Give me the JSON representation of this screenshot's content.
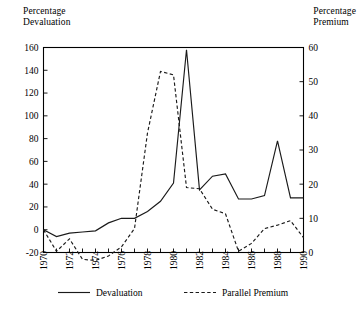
{
  "chart_data": {
    "type": "line",
    "title": "",
    "xlabel": "",
    "ylabel": "Percentage Devaluation",
    "y2label": "Percentage Premium",
    "grid": false,
    "legend_position": "bottom",
    "x": [
      1970,
      1971,
      1972,
      1973,
      1974,
      1975,
      1976,
      1977,
      1978,
      1979,
      1980,
      1981,
      1982,
      1983,
      1984,
      1985,
      1986,
      1987,
      1988,
      1989,
      1990
    ],
    "xlim": [
      1970,
      1990
    ],
    "xticks_major": [
      1970,
      1972,
      1974,
      1976,
      1978,
      1980,
      1982,
      1984,
      1986,
      1988,
      1990
    ],
    "xtick_labels": [
      "1970",
      "1972",
      "1974",
      "1976",
      "1978",
      "1980",
      "1982",
      "1984",
      "1986",
      "1988",
      "1990"
    ],
    "xticks_minor": [
      1971,
      1973,
      1975,
      1977,
      1979,
      1981,
      1983,
      1985,
      1987,
      1989
    ],
    "ylim": [
      -20,
      160
    ],
    "yticks": [
      -20,
      0,
      20,
      40,
      60,
      80,
      100,
      120,
      140,
      160
    ],
    "ytick_labels": [
      "-20",
      "0",
      "20",
      "40",
      "60",
      "80",
      "100",
      "120",
      "140",
      "160"
    ],
    "y2lim": [
      0,
      60
    ],
    "y2ticks": [
      0,
      10,
      20,
      30,
      40,
      50,
      60
    ],
    "y2tick_labels": [
      "0",
      "10",
      "20",
      "30",
      "40",
      "50",
      "60"
    ],
    "series": [
      {
        "name": "Devaluation",
        "style": "solid",
        "axis": "left",
        "color": "#1a1a1a",
        "values": [
          0,
          -6,
          -3,
          -2,
          -1,
          6,
          10,
          10,
          16,
          25,
          41,
          158,
          35,
          47,
          49,
          27,
          27,
          30,
          78,
          28,
          28
        ]
      },
      {
        "name": "Parallel Premium",
        "style": "dashed",
        "axis": "right",
        "color": "#1a1a1a",
        "values": [
          6.7,
          0.3,
          4.0,
          -2.0,
          -2.3,
          -1.0,
          1.7,
          7.0,
          35.0,
          53.0,
          52.0,
          19.0,
          18.7,
          12.7,
          11.3,
          0.3,
          2.7,
          7.0,
          8.0,
          9.3,
          4.3
        ],
        "values_left_scale": [
          0,
          -19,
          -8,
          -26,
          -27,
          -23,
          -15,
          1,
          85,
          139,
          136,
          37,
          36,
          18,
          14,
          -19,
          -12,
          1,
          4,
          8,
          -7
        ]
      }
    ],
    "legend": [
      {
        "label": "Devaluation",
        "style": "solid"
      },
      {
        "label": "Parallel Premium",
        "style": "dashed"
      }
    ]
  },
  "labels": {
    "left_axis_title": "Percentage\nDevaluation",
    "right_axis_title": "Percentage\nPremium"
  }
}
